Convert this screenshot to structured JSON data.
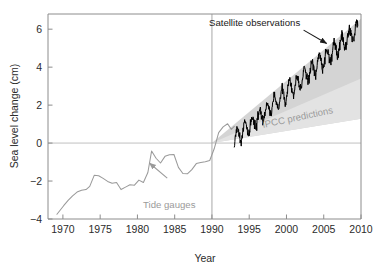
{
  "chart_data": {
    "type": "line",
    "title": "",
    "xlabel": "Year",
    "ylabel": "Sea level change (cm)",
    "xlim": [
      1968,
      2010
    ],
    "ylim": [
      -4,
      6.8
    ],
    "xticks": [
      1970,
      1975,
      1980,
      1985,
      1990,
      1995,
      2000,
      2005,
      2010
    ],
    "yticks": [
      -4,
      -2,
      0,
      2,
      4,
      6
    ],
    "grid": false,
    "legend_position": "none",
    "zero_line": 0,
    "divider_year": 1990,
    "annotations": [
      {
        "name": "satellite-observations",
        "text": "Satellite observations",
        "color": "#1a1a1a",
        "rotation": 0,
        "arrow": {
          "from_xy": [
            2002.3,
            5.95
          ],
          "to_xy": [
            2005.4,
            5.25
          ]
        }
      },
      {
        "name": "ipcc-predictions",
        "text": "IPCC predictions",
        "color": "#9a9a9a",
        "rotation": -12,
        "arrow": null
      },
      {
        "name": "tide-gauges",
        "text": "Tide gauges",
        "color": "#9a9a9a",
        "rotation": 0,
        "arrow": {
          "from_xy": [
            1984.0,
            -1.85
          ],
          "to_xy": [
            1981.6,
            -1.05
          ]
        }
      }
    ],
    "series": [
      {
        "name": "Tide gauges",
        "type": "line",
        "color": "#9a9a9a",
        "x": [
          1969.2,
          1969.6,
          1970.1,
          1970.7,
          1971.3,
          1971.9,
          1972.5,
          1973.1,
          1973.6,
          1974.2,
          1974.8,
          1975.4,
          1976.0,
          1976.6,
          1977.2,
          1977.8,
          1978.4,
          1979.0,
          1979.6,
          1980.2,
          1980.8,
          1981.4,
          1981.9,
          1982.5,
          1983.1,
          1983.7,
          1984.3,
          1984.9,
          1985.5,
          1986.1,
          1986.7,
          1987.3,
          1987.9,
          1988.5,
          1989.1,
          1989.7,
          1990.3,
          1990.9,
          1991.5,
          1992.1,
          1992.6,
          1993.0
        ],
        "y": [
          -3.75,
          -3.55,
          -3.3,
          -3.02,
          -2.78,
          -2.58,
          -2.48,
          -2.45,
          -2.28,
          -1.7,
          -1.72,
          -1.86,
          -2.02,
          -2.12,
          -2.08,
          -2.45,
          -2.32,
          -2.2,
          -2.22,
          -1.95,
          -2.08,
          -1.55,
          -0.42,
          -0.8,
          -1.05,
          -0.7,
          -0.62,
          -0.6,
          -1.28,
          -1.6,
          -1.62,
          -1.4,
          -1.08,
          -1.02,
          -0.98,
          -0.92,
          -0.3,
          0.55,
          0.85,
          1.02,
          0.72,
          0.88
        ]
      },
      {
        "name": "Satellite observations",
        "type": "line",
        "color": "#000000",
        "start_year": 1993.0,
        "end_year": 2009.6,
        "start_value": 0.22,
        "end_value": 5.98,
        "trend_cm_per_year": 0.347,
        "seasonal_amplitude_cm": 0.42,
        "noise_amplitude_cm": 0.22
      }
    ],
    "bands": [
      {
        "name": "IPCC predictions",
        "type": "area",
        "color": "#d4d4d4",
        "apex_xy": [
          1990.0,
          0.0
        ],
        "upper_end_xy": [
          2010.0,
          6.55
        ],
        "lower_end_xy": [
          2010.0,
          1.28
        ]
      },
      {
        "name": "IPCC predictions inner",
        "type": "area",
        "color": "#e3e3e3",
        "apex_xy": [
          1990.0,
          0.0
        ],
        "upper_end_xy": [
          2010.0,
          3.4
        ],
        "lower_end_xy": [
          2010.0,
          1.28
        ]
      }
    ]
  },
  "figure": {
    "background": "#ffffff",
    "axis_color": "#8c8c8c",
    "text_color": "#2b2b2b"
  }
}
